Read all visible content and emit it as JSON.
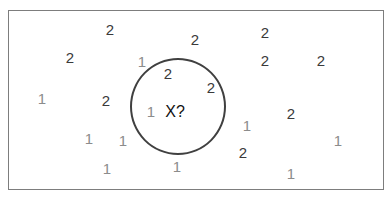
{
  "diagram": {
    "title": "",
    "colors": {
      "class_1": "#8c8c8c",
      "class_2": "#3a3a3a",
      "query": "#111111",
      "circle": "#404040",
      "frame": "#7d7d7d"
    },
    "query": {
      "label": "X?",
      "x": 175,
      "y": 111
    },
    "circle": {
      "cx": 178,
      "cy": 106,
      "r": 48
    },
    "points": [
      {
        "label": "2",
        "cls": 2,
        "x": 110,
        "y": 29
      },
      {
        "label": "2",
        "cls": 2,
        "x": 70,
        "y": 57
      },
      {
        "label": "2",
        "cls": 2,
        "x": 195,
        "y": 39
      },
      {
        "label": "1",
        "cls": 1,
        "x": 142,
        "y": 61
      },
      {
        "label": "2",
        "cls": 2,
        "x": 265,
        "y": 32
      },
      {
        "label": "2",
        "cls": 2,
        "x": 265,
        "y": 60
      },
      {
        "label": "2",
        "cls": 2,
        "x": 321,
        "y": 60
      },
      {
        "label": "2",
        "cls": 2,
        "x": 168,
        "y": 73
      },
      {
        "label": "2",
        "cls": 2,
        "x": 211,
        "y": 87
      },
      {
        "label": "1",
        "cls": 1,
        "x": 42,
        "y": 98
      },
      {
        "label": "2",
        "cls": 2,
        "x": 106,
        "y": 100
      },
      {
        "label": "1",
        "cls": 1,
        "x": 151,
        "y": 111
      },
      {
        "label": "2",
        "cls": 2,
        "x": 291,
        "y": 113
      },
      {
        "label": "1",
        "cls": 1,
        "x": 247,
        "y": 125
      },
      {
        "label": "1",
        "cls": 1,
        "x": 89,
        "y": 138
      },
      {
        "label": "1",
        "cls": 1,
        "x": 123,
        "y": 140
      },
      {
        "label": "1",
        "cls": 1,
        "x": 338,
        "y": 140
      },
      {
        "label": "2",
        "cls": 2,
        "x": 243,
        "y": 152
      },
      {
        "label": "1",
        "cls": 1,
        "x": 177,
        "y": 166
      },
      {
        "label": "1",
        "cls": 1,
        "x": 107,
        "y": 168
      },
      {
        "label": "1",
        "cls": 1,
        "x": 291,
        "y": 173
      }
    ]
  }
}
